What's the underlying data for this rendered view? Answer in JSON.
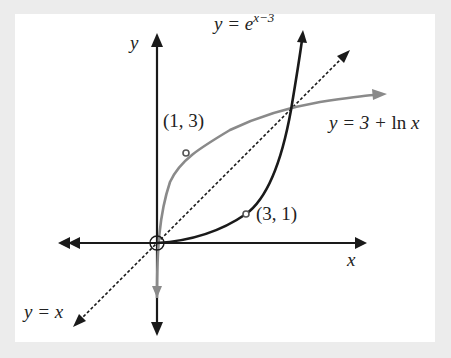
{
  "diagram": {
    "axes": {
      "x_label": "x",
      "y_label": "y"
    },
    "curves": [
      {
        "name": "exponential",
        "label_lhs": "y = e",
        "label_exp": "x−3",
        "color": "#1a1a1a"
      },
      {
        "name": "logarithm",
        "label_lhs": "y = 3 + ",
        "label_fn": "ln",
        "label_var": " x",
        "color": "#8a8a8a"
      },
      {
        "name": "identity",
        "label": "y = x",
        "style": "dashed",
        "color": "#1a1a1a"
      }
    ],
    "points": [
      {
        "label": "(1, 3)",
        "x": 1,
        "y": 3
      },
      {
        "label": "(3, 1)",
        "x": 3,
        "y": 1
      }
    ],
    "colors": {
      "background": "#ececec",
      "panel": "#ffffff",
      "axis": "#1a1a1a",
      "log_curve": "#8a8a8a"
    }
  }
}
